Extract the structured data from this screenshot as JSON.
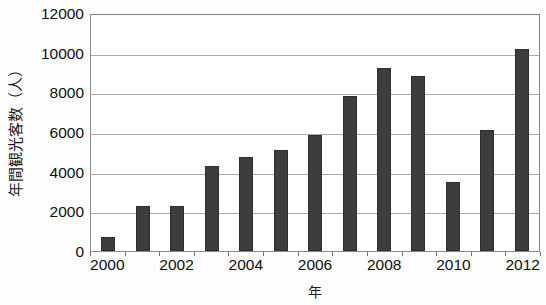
{
  "chart_data": {
    "type": "bar",
    "title": "",
    "xlabel": "年",
    "ylabel": "年間観光客数（人）",
    "categories": [
      "2000",
      "2001",
      "2002",
      "2003",
      "2004",
      "2005",
      "2006",
      "2007",
      "2008",
      "2009",
      "2010",
      "2011",
      "2012"
    ],
    "values": [
      700,
      2250,
      2250,
      4300,
      4750,
      5100,
      5850,
      7800,
      9250,
      8800,
      3500,
      6100,
      10200
    ],
    "series": [
      {
        "name": "年間観光客数",
        "values": [
          700,
          2250,
          2250,
          4300,
          4750,
          5100,
          5850,
          7800,
          9250,
          8800,
          3500,
          6100,
          10200
        ]
      }
    ],
    "ylim": [
      0,
      12000
    ],
    "y_ticks": [
      0,
      2000,
      4000,
      6000,
      8000,
      10000,
      12000
    ],
    "y_tick_labels": [
      "0",
      "2000",
      "4000",
      "6000",
      "8000",
      "10000",
      "12000"
    ],
    "x_tick_labels": [
      "2000",
      "2002",
      "2004",
      "2006",
      "2008",
      "2010",
      "2012"
    ],
    "x_tick_label_indices": [
      0,
      2,
      4,
      6,
      8,
      10,
      12
    ],
    "grid": true,
    "grid_axis": "y",
    "legend": false,
    "legend_position": "none",
    "bar_color": "#3d3d3d",
    "grid_color": "#a9a9a9",
    "axis_color": "#8a8a8a",
    "background_color": "#ffffff"
  }
}
